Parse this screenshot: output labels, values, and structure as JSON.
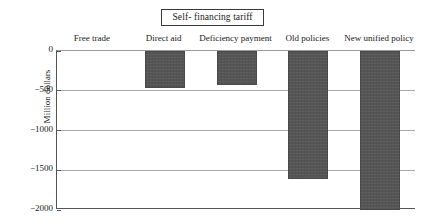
{
  "chart_data": {
    "type": "bar",
    "title": "Self- financing tariff",
    "xlabel": "",
    "ylabel": "Million dollars",
    "categories": [
      "Free trade",
      "Direct aid",
      "Deficiency payment",
      "Old policies",
      "New unified policy"
    ],
    "values": [
      0,
      -460,
      -430,
      -1610,
      -2000
    ],
    "ylim": [
      -2000,
      0
    ],
    "yticks": [
      0,
      -500,
      -1000,
      -1500,
      -2000
    ],
    "ytick_labels": [
      "0",
      "−500",
      "−1000",
      "−1500",
      "−2000"
    ],
    "grid": true,
    "legend": "none",
    "annotations": [
      "Total annual cost to EC consumers"
    ],
    "bar_color": "#555555"
  },
  "title": {
    "text": "Self- financing tariff"
  },
  "axis": {
    "y_title": "Million dollars"
  },
  "annotation": {
    "text": "Total annual cost to EC consumers"
  }
}
